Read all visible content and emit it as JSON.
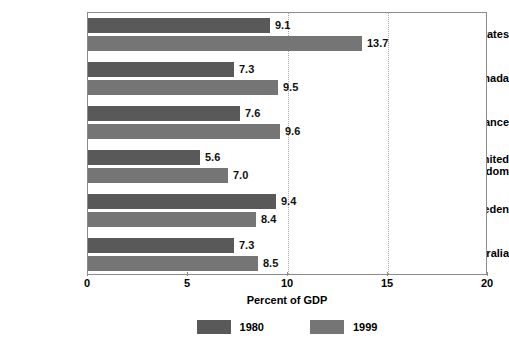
{
  "chart_data": {
    "type": "bar",
    "orientation": "horizontal",
    "title": "",
    "xlabel": "Percent of GDP",
    "ylabel": "",
    "xlim": [
      0,
      20
    ],
    "xticks": [
      0,
      5,
      10,
      15,
      20
    ],
    "xtick_labels": [
      "0",
      "5",
      "10",
      "15",
      "20"
    ],
    "grid": "vertical dotted gridlines at 10 and 15",
    "gridlines": [
      10,
      15
    ],
    "legend_position": "bottom-center",
    "categories": [
      "United States",
      "Canada",
      "France",
      "United Kingdom",
      "Sweden",
      "Australia"
    ],
    "category_labels": [
      [
        "United States"
      ],
      [
        "Canada"
      ],
      [
        "France"
      ],
      [
        "United",
        "Kingdom"
      ],
      [
        "Sweden"
      ],
      [
        "Australia"
      ]
    ],
    "series": [
      {
        "name": "1980",
        "color": "#595959",
        "values": [
          9.1,
          7.3,
          7.6,
          5.6,
          9.4,
          7.3
        ],
        "value_labels": [
          "9.1",
          "7.3",
          "7.6",
          "5.6",
          "9.4",
          "7.3"
        ]
      },
      {
        "name": "1999",
        "color": "#757575",
        "values": [
          13.7,
          9.5,
          9.6,
          7.0,
          8.4,
          8.5
        ],
        "value_labels": [
          "13.7",
          "9.5",
          "9.6",
          "7.0",
          "8.4",
          "8.5"
        ]
      }
    ]
  },
  "legend": {
    "items": [
      {
        "label": "1980",
        "color": "#595959"
      },
      {
        "label": "1999",
        "color": "#757575"
      }
    ]
  },
  "axis": {
    "x_title": "Percent of GDP",
    "tick_labels": [
      "0",
      "5",
      "10",
      "15",
      "20"
    ]
  }
}
